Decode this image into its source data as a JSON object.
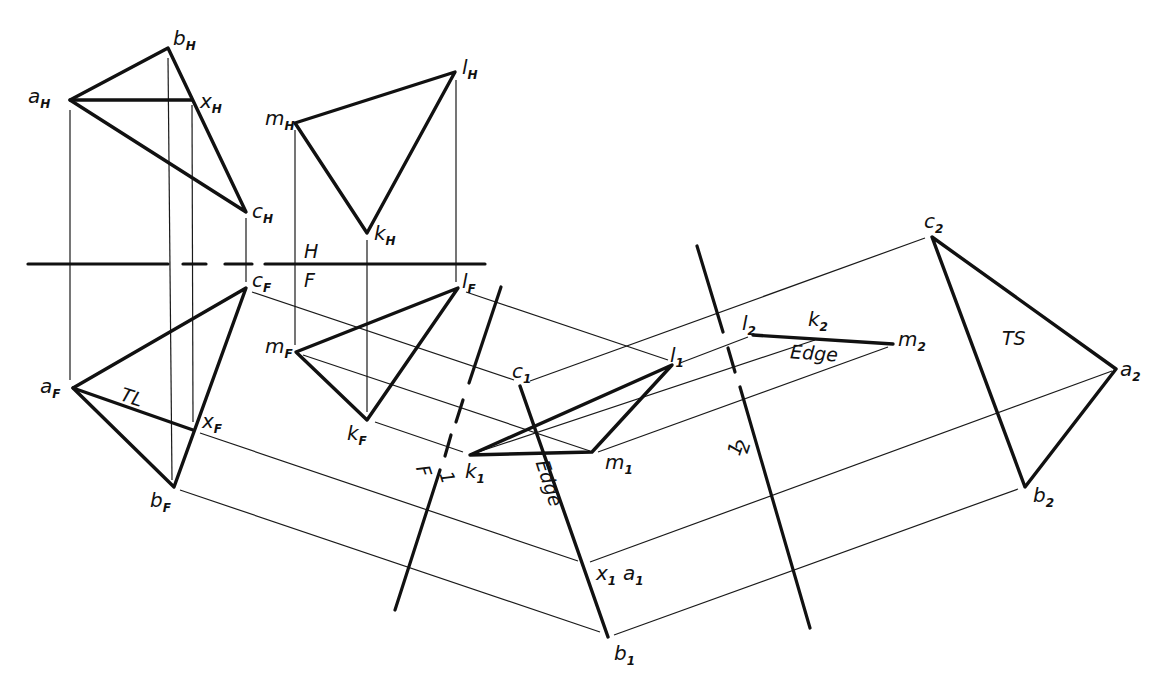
{
  "figure": {
    "colors": {
      "ink": "#111111",
      "paper": "#ffffff"
    }
  },
  "views": {
    "horizontal": {
      "label": "H",
      "triangle_abc": {
        "a": "a",
        "b": "b",
        "c": "c",
        "x": "x",
        "sub": "H"
      },
      "triangle_klm": {
        "k": "k",
        "l": "l",
        "m": "m",
        "sub": "H"
      }
    },
    "frontal": {
      "label": "F",
      "triangle_abc": {
        "a": "a",
        "b": "b",
        "c": "c",
        "x": "x",
        "sub": "F"
      },
      "triangle_klm": {
        "k": "k",
        "l": "l",
        "m": "m",
        "sub": "F"
      },
      "true_length_note": "TL"
    },
    "auxiliary_1": {
      "triangle_abc": {
        "a": "a",
        "b": "b",
        "c": "c",
        "x": "x",
        "sub": "1"
      },
      "triangle_klm": {
        "k": "k",
        "l": "l",
        "m": "m",
        "sub": "1"
      },
      "edge_note": "Edge"
    },
    "auxiliary_2": {
      "triangle_abc": {
        "a": "a",
        "b": "b",
        "c": "c",
        "sub": "2"
      },
      "triangle_klm": {
        "k": "k",
        "l": "l",
        "m": "m",
        "sub": "2"
      },
      "edge_note": "Edge",
      "true_shape_note": "TS"
    }
  },
  "fold_lines": {
    "hf": {
      "upper": "H",
      "lower": "F"
    },
    "f1": {
      "left": "F",
      "right": "1"
    },
    "one_two": {
      "left": "1",
      "right": "2"
    }
  }
}
